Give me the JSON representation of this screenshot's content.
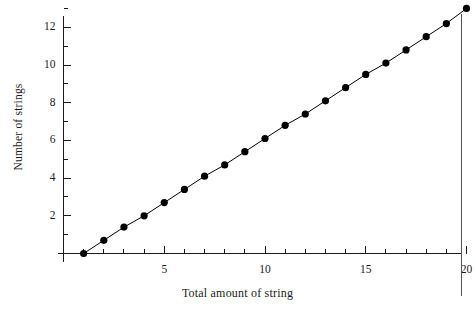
{
  "chart_data": {
    "type": "line",
    "title": "",
    "xlabel": "Total amount of string",
    "ylabel": "Number of strings",
    "xlim": [
      0,
      20.6
    ],
    "ylim": [
      -0.1,
      13.4
    ],
    "grid": false,
    "legend": null,
    "marker": "filled-circle",
    "marker_color": "#000000",
    "line_color": "#000000",
    "x_major_ticks": [
      5,
      10,
      15,
      20
    ],
    "x_minor_ticks": [
      1,
      2,
      3,
      4,
      6,
      7,
      8,
      9,
      11,
      12,
      13,
      14,
      16,
      17,
      18,
      19
    ],
    "y_major_ticks": [
      2,
      4,
      6,
      8,
      10,
      12
    ],
    "y_minor_ticks": [
      1,
      3,
      5,
      7,
      9,
      11,
      13
    ],
    "x_tick_labels": [
      "5",
      "10",
      "15",
      "20"
    ],
    "y_tick_labels": [
      "2",
      "4",
      "6",
      "8",
      "10",
      "12"
    ],
    "x": [
      1,
      2,
      3,
      4,
      5,
      6,
      7,
      8,
      9,
      10,
      11,
      12,
      13,
      14,
      15,
      16,
      17,
      18,
      19,
      20
    ],
    "values": [
      0.0,
      0.7,
      1.4,
      2.0,
      2.7,
      3.4,
      4.1,
      4.7,
      5.4,
      6.1,
      6.8,
      7.4,
      8.1,
      8.8,
      9.5,
      10.1,
      10.8,
      11.5,
      12.2,
      13.0
    ],
    "series": [
      {
        "name": "Number of strings",
        "x": [
          1,
          2,
          3,
          4,
          5,
          6,
          7,
          8,
          9,
          10,
          11,
          12,
          13,
          14,
          15,
          16,
          17,
          18,
          19,
          20
        ],
        "values": [
          0.0,
          0.7,
          1.4,
          2.0,
          2.7,
          3.4,
          4.1,
          4.7,
          5.4,
          6.1,
          6.8,
          7.4,
          8.1,
          8.8,
          9.5,
          10.1,
          10.8,
          11.5,
          12.2,
          13.0
        ]
      }
    ]
  }
}
